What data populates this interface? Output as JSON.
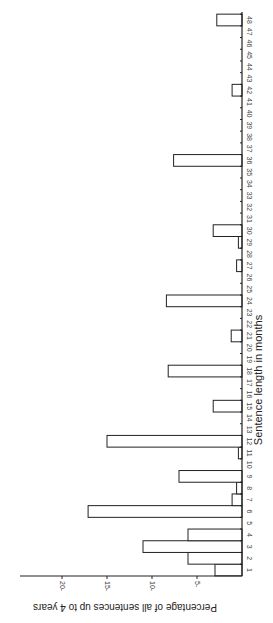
{
  "chart_data": {
    "type": "bar",
    "orientation": "rotated-90 (categories run bottom-to-top along right edge, bars extend leftward)",
    "title": "",
    "xlabel": "Sentence length in months",
    "ylabel": "Percentage of all sentences up to 4 years",
    "categories": [
      "1",
      "2",
      "3",
      "4",
      "5",
      "6",
      "7",
      "8",
      "9",
      "10",
      "11",
      "12",
      "13",
      "14",
      "15",
      "16",
      "17",
      "18",
      "19",
      "20",
      "21",
      "22",
      "23",
      "24",
      "25",
      "26",
      "27",
      "28",
      "29",
      "30",
      "31",
      "32",
      "33",
      "34",
      "35",
      "36",
      "37",
      "38",
      "39",
      "40",
      "41",
      "42",
      "43",
      "44",
      "45",
      "46",
      "47",
      "48"
    ],
    "values": [
      3.0,
      6.0,
      11.0,
      6.0,
      0,
      17.1,
      1.1,
      0.6,
      7.0,
      0,
      0.4,
      15.0,
      0,
      0,
      3.2,
      0,
      0,
      8.2,
      0,
      0,
      1.2,
      0,
      0,
      8.4,
      0,
      0,
      0.6,
      0,
      0.4,
      3.2,
      0,
      0,
      0,
      0,
      0,
      7.6,
      0,
      0,
      0,
      0,
      0,
      1.1,
      0,
      0,
      0,
      0,
      0,
      2.8
    ],
    "yticks": [
      5,
      10,
      15,
      20
    ],
    "ylim": [
      0,
      24
    ],
    "grid": false,
    "legend": null
  }
}
